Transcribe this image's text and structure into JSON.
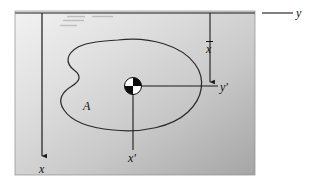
{
  "figure": {
    "background_color": "#ffffff",
    "plate": {
      "name": "gray-plate",
      "x": 15,
      "y": 11,
      "width": 240,
      "height": 164,
      "fill_light": "#efefef",
      "fill_dark": "#a8a8a8",
      "border_color": "#6f6f6f"
    },
    "line_color": "#1a1a1a",
    "axes": {
      "y_axis": {
        "label": "y",
        "orientation": "horizontal",
        "y": 13,
        "x_start": 15,
        "x_end": 292
      },
      "x_axis": {
        "label": "x",
        "orientation": "vertical",
        "x": 42,
        "y_start": 13,
        "y_end": 160,
        "arrow": "down"
      },
      "x_prime_axis": {
        "label": "x'",
        "orientation": "vertical",
        "x": 133,
        "y_start": 86,
        "y_end": 150
      },
      "y_prime_axis": {
        "label": "y'",
        "orientation": "horizontal",
        "y": 86,
        "x_start": 133,
        "x_end": 218
      }
    },
    "dimension": {
      "name": "x-bar-dimension",
      "label": "x",
      "overbar": true,
      "x": 210,
      "y_start": 13,
      "y_end": 86,
      "arrow": "down"
    },
    "area": {
      "label": "A",
      "label_x": 83,
      "label_y": 100,
      "outline_color": "#2b2b2b"
    },
    "centroid": {
      "name": "centroid-marker",
      "cx": 133,
      "cy": 86,
      "r": 8.5,
      "quadrants": [
        "white",
        "black",
        "black",
        "white"
      ]
    },
    "hatch_marks": [
      {
        "x1": 67,
        "y1": 16,
        "x2": 85,
        "y2": 16
      },
      {
        "x1": 92,
        "y1": 16,
        "x2": 112,
        "y2": 16
      },
      {
        "x1": 63,
        "y1": 20,
        "x2": 83,
        "y2": 20
      },
      {
        "x1": 60,
        "y1": 25,
        "x2": 76,
        "y2": 25
      }
    ]
  }
}
